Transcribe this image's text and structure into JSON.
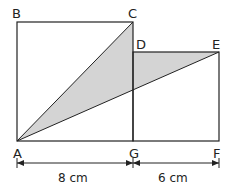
{
  "figure": {
    "points": {
      "A": "A",
      "B": "B",
      "C": "C",
      "D": "D",
      "E": "E",
      "F": "F",
      "G": "G"
    },
    "dimensions": {
      "AG": "8 cm",
      "GF": "6 cm"
    },
    "colors": {
      "line": "#222222",
      "shade": "#cfcfcf",
      "background": "#ffffff"
    }
  }
}
